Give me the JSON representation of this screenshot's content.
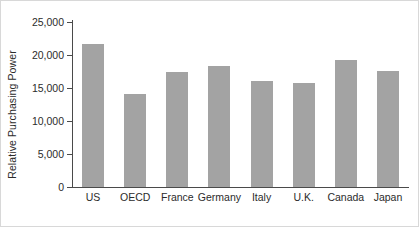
{
  "chart_data": {
    "type": "bar",
    "title": "",
    "subtitle": "",
    "xlabel": "",
    "ylabel": "Relative Purchasing Power",
    "categories": [
      "US",
      "OECD",
      "France",
      "Germany",
      "Italy",
      "U.K.",
      "Canada",
      "Japan"
    ],
    "values": [
      21600,
      14100,
      17400,
      18400,
      16000,
      15700,
      19200,
      17600
    ],
    "series": [
      {
        "name": "Relative Purchasing Power",
        "values": [
          21600,
          14100,
          17400,
          18400,
          16000,
          15700,
          19200,
          17600
        ]
      }
    ],
    "ylim": [
      0,
      25000
    ],
    "ytick_labels": [
      "0",
      "5,000",
      "10,000",
      "15,000",
      "20,000",
      "25,000"
    ],
    "ytick_values": [
      0,
      5000,
      10000,
      15000,
      20000,
      25000
    ],
    "grid": false,
    "legend": null,
    "legend_position": "none",
    "bar_color": "#a3a3a3",
    "axis_color": "#4a4a4a",
    "text_color": "#2b2b2b",
    "frame_color": "#d8d8d8",
    "background": "#ffffff"
  }
}
